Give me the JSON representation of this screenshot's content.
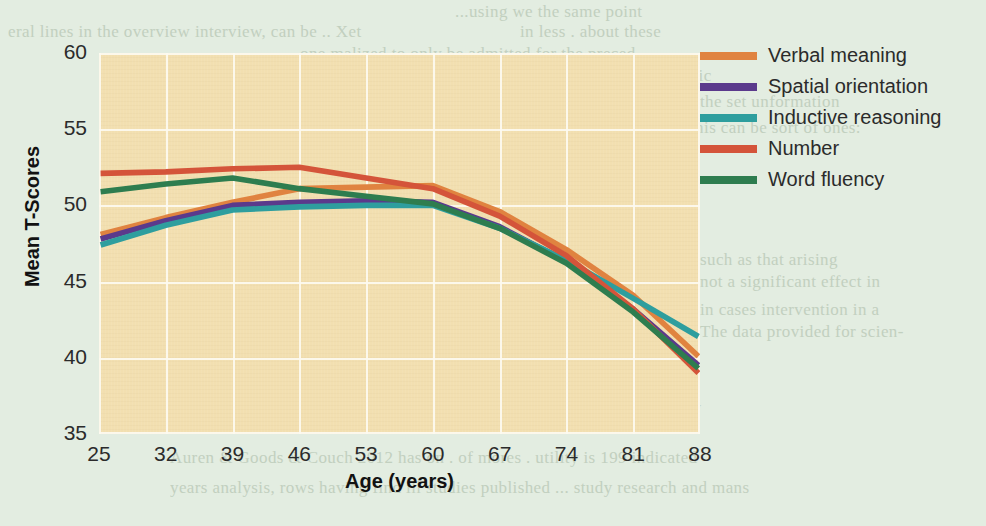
{
  "page": {
    "background_color": "#e3ede1",
    "bleed_text": [
      {
        "text": "...using we the same point",
        "x": 455,
        "y": 2
      },
      {
        "text": "eral lines in the overview interview, can be .. Xet",
        "x": 8,
        "y": 22
      },
      {
        "text": "in less . about these",
        "x": 520,
        "y": 22
      },
      {
        "text": "one malized to only be admitted for the preced-",
        "x": 300,
        "y": 44
      },
      {
        "text": "the same of what approach is that a .... stress in basic",
        "x": 330,
        "y": 66
      },
      {
        "text": "an rang on the two forms of was in ... not the",
        "x": 345,
        "y": 92
      },
      {
        "text": "the set unformation",
        "x": 700,
        "y": 92
      },
      {
        "text": "this can be sort of ones:",
        "x": 690,
        "y": 118
      },
      {
        "text": "In reen, changes through the than ... The",
        "x": 170,
        "y": 200
      },
      {
        "text": "support for a measure more secure . . . posi-",
        "x": 170,
        "y": 226
      },
      {
        "text": "pherical intra personal in research studies leg",
        "x": 170,
        "y": 250
      },
      {
        "text": "such as that arising",
        "x": 700,
        "y": 250
      },
      {
        "text": "thought Partician & Consult e revelation has",
        "x": 170,
        "y": 272
      },
      {
        "text": "not a significant effect in",
        "x": 700,
        "y": 272
      },
      {
        "text": "the people that new and ... eats images and Fac-",
        "x": 170,
        "y": 300
      },
      {
        "text": "in cases intervention in a",
        "x": 700,
        "y": 300
      },
      {
        "text": "researchers find that potentiation issues with a",
        "x": 170,
        "y": 322
      },
      {
        "text": "The data provided for scien-",
        "x": 700,
        "y": 322
      },
      {
        "text": "What cause should the now Which level werent.. rence of the preset, and",
        "x": 170,
        "y": 348
      },
      {
        "text": "static.  Meta analysis tions, cover key a .. was consider the larger and ?",
        "x": 170,
        "y": 372
      },
      {
        "text": "the reads it thereof a common the work on the mans in of as .. a speciality",
        "x": 170,
        "y": 398
      },
      {
        "text": "Auren & Goods & Couch 2012 has on . of mores . utility is 199 indicated",
        "x": 170,
        "y": 448
      },
      {
        "text": "years analysis, rows having find ill studies published ... study research and mans",
        "x": 170,
        "y": 478
      }
    ]
  },
  "chart_data": {
    "type": "line",
    "title": "",
    "xlabel": "Age (years)",
    "ylabel": "Mean T-Scores",
    "categories": [
      25,
      32,
      39,
      46,
      53,
      60,
      67,
      74,
      81,
      88
    ],
    "xlim": [
      25,
      88
    ],
    "ylim": [
      35,
      60
    ],
    "yticks": [
      35,
      40,
      45,
      50,
      55,
      60
    ],
    "xticks": [
      25,
      32,
      39,
      46,
      53,
      60,
      67,
      74,
      81,
      88
    ],
    "grid": true,
    "legend_position": "right",
    "plot_background": "#f2dfb0",
    "gridline_color": "#fdfaf0",
    "series": [
      {
        "name": "Verbal meaning",
        "color": "#e08340",
        "values": [
          48.1,
          49.2,
          50.2,
          51.1,
          51.2,
          51.3,
          49.6,
          47.1,
          44.1,
          40.1
        ]
      },
      {
        "name": "Spatial orientation",
        "color": "#5b3a8c",
        "values": [
          47.8,
          49.0,
          50.0,
          50.2,
          50.3,
          50.2,
          48.6,
          46.3,
          43.2,
          39.5
        ]
      },
      {
        "name": "Inductive reasoning",
        "color": "#2e9e9e",
        "values": [
          47.4,
          48.7,
          49.7,
          49.9,
          50.0,
          50.0,
          48.5,
          46.4,
          43.9,
          41.4
        ]
      },
      {
        "name": "Number",
        "color": "#d4543a",
        "values": [
          52.1,
          52.2,
          52.4,
          52.5,
          51.8,
          51.1,
          49.3,
          46.7,
          43.2,
          39.0
        ]
      },
      {
        "name": "Word fluency",
        "color": "#2e7d4f",
        "values": [
          50.9,
          51.4,
          51.8,
          51.1,
          50.6,
          50.1,
          48.5,
          46.2,
          43.0,
          39.3
        ]
      }
    ]
  }
}
